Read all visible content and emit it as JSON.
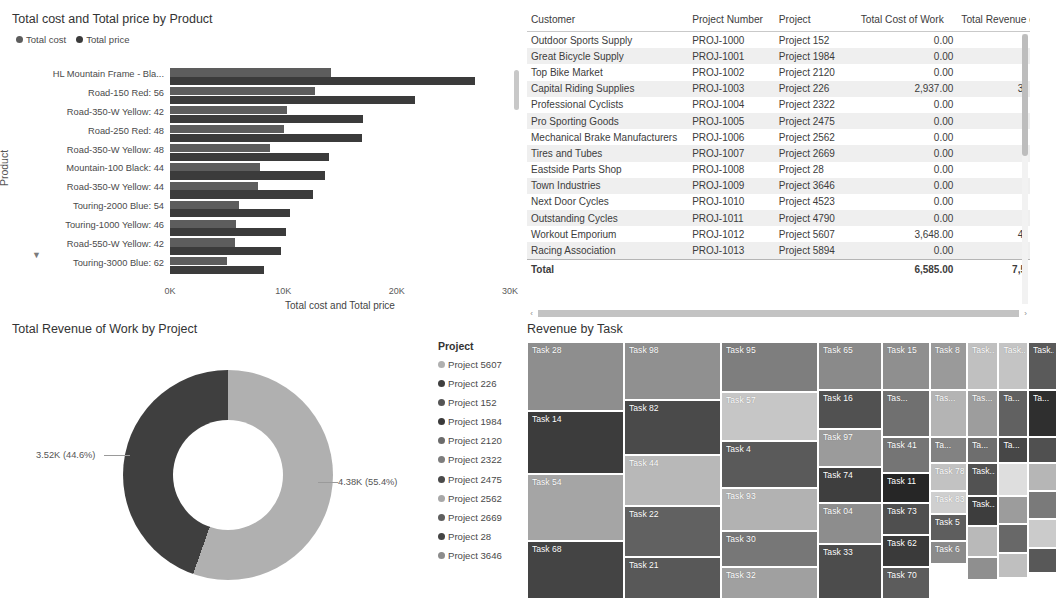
{
  "chart_data": [
    {
      "type": "bar",
      "id": "total-cost-price-by-product",
      "title": "Total cost and Total price by Product",
      "xlabel": "Total cost and Total price",
      "ylabel": "Product",
      "orientation": "horizontal",
      "grouped": true,
      "xlim": [
        0,
        30000
      ],
      "xticks": [
        "0K",
        "10K",
        "20K",
        "30K"
      ],
      "xtick_values": [
        0,
        10000,
        20000,
        30000
      ],
      "legend": [
        {
          "label": "Total cost",
          "color": "#5d5d5d"
        },
        {
          "label": "Total price",
          "color": "#3b3b3b"
        }
      ],
      "categories": [
        "HL Mountain Frame - Bla...",
        "Road-150 Red: 56",
        "Road-350-W Yellow: 42",
        "Road-250 Red: 48",
        "Road-350-W Yellow: 48",
        "Mountain-100 Black: 44",
        "Road-350-W Yellow: 44",
        "Touring-2000 Blue: 54",
        "Touring-1000 Yellow: 46",
        "Road-550-W Yellow: 42",
        "Touring-3000 Blue: 62"
      ],
      "series": [
        {
          "name": "Total cost",
          "color": "#5d5d5d",
          "values": [
            14200,
            12800,
            10300,
            10100,
            8800,
            7900,
            7800,
            6100,
            5800,
            5700,
            5000
          ]
        },
        {
          "name": "Total price",
          "color": "#3b3b3b",
          "values": [
            26900,
            21600,
            17000,
            16900,
            14000,
            13700,
            12600,
            10600,
            10200,
            9800,
            8300
          ]
        }
      ]
    },
    {
      "type": "pie",
      "id": "total-revenue-of-work-by-project",
      "title": "Total Revenue of Work by Project",
      "donut": true,
      "legend_title": "Project",
      "legend_position": "right",
      "slices": [
        {
          "label": "Project 5607",
          "value": 4380,
          "display": "4.38K (55.4%)",
          "percent": 55.4,
          "color": "#b0b0b0"
        },
        {
          "label": "Project 226",
          "value": 3520,
          "display": "3.52K (44.6%)",
          "percent": 44.6,
          "color": "#3f3f3f"
        }
      ],
      "legend_items": [
        {
          "label": "Project 5607",
          "color": "#b0b0b0"
        },
        {
          "label": "Project 226",
          "color": "#3f3f3f"
        },
        {
          "label": "Project 152",
          "color": "#555555"
        },
        {
          "label": "Project 1984",
          "color": "#3a3a3a"
        },
        {
          "label": "Project 2120",
          "color": "#6b6b6b"
        },
        {
          "label": "Project 2322",
          "color": "#7d7d7d"
        },
        {
          "label": "Project 2475",
          "color": "#4a4a4a"
        },
        {
          "label": "Project 2562",
          "color": "#a8a8a8"
        },
        {
          "label": "Project 2669",
          "color": "#5f5f5f"
        },
        {
          "label": "Project 28",
          "color": "#444444"
        },
        {
          "label": "Project 3646",
          "color": "#8c8c8c"
        }
      ],
      "more_indicator": "▼"
    },
    {
      "type": "treemap",
      "id": "revenue-by-task",
      "title": "Revenue by Task",
      "columns": [
        {
          "width_pct": 19.1,
          "cells": [
            {
              "label": "Task 28",
              "h_pct": 27.0,
              "color": "#8e8e8e"
            },
            {
              "label": "Task 14",
              "h_pct": 24.5,
              "color": "#3c3c3c"
            },
            {
              "label": "Task 54",
              "h_pct": 26.0,
              "color": "#a5a5a5"
            },
            {
              "label": "Task 68",
              "h_pct": 22.5,
              "color": "#444444"
            }
          ]
        },
        {
          "width_pct": 19.1,
          "cells": [
            {
              "label": "Task 98",
              "h_pct": 22.5,
              "color": "#909090"
            },
            {
              "label": "Task 82",
              "h_pct": 21.5,
              "color": "#4a4a4a"
            },
            {
              "label": "Task 44",
              "h_pct": 20.0,
              "color": "#b8b8b8"
            },
            {
              "label": "Task 22",
              "h_pct": 19.5,
              "color": "#616161"
            },
            {
              "label": "Task 21",
              "h_pct": 16.5,
              "color": "#585858"
            }
          ]
        },
        {
          "width_pct": 19.1,
          "cells": [
            {
              "label": "Task 95",
              "h_pct": 19.5,
              "color": "#7e7e7e"
            },
            {
              "label": "Task 57",
              "h_pct": 19.0,
              "color": "#c6c6c6"
            },
            {
              "label": "Task 4",
              "h_pct": 18.5,
              "color": "#5a5a5a"
            },
            {
              "label": "Task 93",
              "h_pct": 16.5,
              "color": "#b2b2b2"
            },
            {
              "label": "Task 30",
              "h_pct": 14.0,
              "color": "#777777"
            },
            {
              "label": "Task 32",
              "h_pct": 12.5,
              "color": "#a0a0a0"
            }
          ]
        },
        {
          "width_pct": 12.6,
          "cells": [
            {
              "label": "Task 65",
              "h_pct": 18.5,
              "color": "#8a8a8a"
            },
            {
              "label": "Task 16",
              "h_pct": 15.5,
              "color": "#515151"
            },
            {
              "label": "Task 97",
              "h_pct": 14.5,
              "color": "#9b9b9b"
            },
            {
              "label": "Task 74",
              "h_pct": 14.0,
              "color": "#3e3e3e"
            },
            {
              "label": "Task 04",
              "h_pct": 16.0,
              "color": "#8d8d8d"
            },
            {
              "label": "Task 33",
              "h_pct": 21.5,
              "color": "#4c4c4c"
            }
          ]
        },
        {
          "width_pct": 9.4,
          "cells": [
            {
              "label": "Task 15",
              "h_pct": 18.5,
              "color": "#8f8f8f"
            },
            {
              "label": "Tas...",
              "h_pct": 18.5,
              "color": "#707070"
            },
            {
              "label": "Task 41",
              "h_pct": 14.0,
              "color": "#757575"
            },
            {
              "label": "Task 11",
              "h_pct": 11.5,
              "color": "#262626"
            },
            {
              "label": "Task 73",
              "h_pct": 12.5,
              "color": "#4f4f4f"
            },
            {
              "label": "Task 62",
              "h_pct": 12.5,
              "color": "#3a3a3a"
            },
            {
              "label": "Task 70",
              "h_pct": 12.5,
              "color": "#5c5c5c"
            }
          ]
        },
        {
          "width_pct": 7.3,
          "cells": [
            {
              "label": "Task 8",
              "h_pct": 18.5,
              "color": "#9a9a9a"
            },
            {
              "label": "Tas...",
              "h_pct": 18.5,
              "color": "#b4b4b4"
            },
            {
              "label": "Ta...",
              "h_pct": 10.0,
              "color": "#828282"
            },
            {
              "label": "Task 78",
              "h_pct": 11.0,
              "color": "#c2c2c2"
            },
            {
              "label": "Task 83",
              "h_pct": 9.0,
              "color": "#cfcfcf"
            },
            {
              "label": "Task 5",
              "h_pct": 10.5,
              "color": "#5e5e5e"
            },
            {
              "label": "Task 6",
              "h_pct": 9.0,
              "color": "#8b8b8b"
            }
          ]
        },
        {
          "width_pct": 6.2,
          "cells": [
            {
              "label": "Task...",
              "h_pct": 18.5,
              "color": "#c0c0c0"
            },
            {
              "label": "Tas...",
              "h_pct": 18.5,
              "color": "#9d9d9d"
            },
            {
              "label": "Ta...",
              "h_pct": 10.0,
              "color": "#6e6e6e"
            },
            {
              "label": "Task...",
              "h_pct": 13.0,
              "color": "#525252"
            },
            {
              "label": "Task...",
              "h_pct": 11.5,
              "color": "#3d3d3d"
            },
            {
              "label": "",
              "h_pct": 12.0,
              "color": "#b9b9b9"
            },
            {
              "label": "",
              "h_pct": 9.0,
              "color": "#8f8f8f"
            }
          ]
        },
        {
          "width_pct": 5.8,
          "cells": [
            {
              "label": "Task...",
              "h_pct": 18.5,
              "color": "#c4c4c4"
            },
            {
              "label": "Ta...",
              "h_pct": 18.5,
              "color": "#616161"
            },
            {
              "label": "Ta...",
              "h_pct": 10.0,
              "color": "#474747"
            },
            {
              "label": "",
              "h_pct": 13.0,
              "color": "#dedede"
            },
            {
              "label": "",
              "h_pct": 11.0,
              "color": "#9c9c9c"
            },
            {
              "label": "",
              "h_pct": 11.0,
              "color": "#686868"
            },
            {
              "label": "",
              "h_pct": 10.0,
              "color": "#bfbfbf"
            }
          ]
        },
        {
          "width_pct": 5.8,
          "cells": [
            {
              "label": "Task...",
              "h_pct": 18.5,
              "color": "#5a5a5a"
            },
            {
              "label": "Ta...",
              "h_pct": 18.5,
              "color": "#2f2f2f"
            },
            {
              "label": "",
              "h_pct": 10.0,
              "color": "#505050"
            },
            {
              "label": "",
              "h_pct": 11.0,
              "color": "#b6b6b6"
            },
            {
              "label": "",
              "h_pct": 11.0,
              "color": "#7a7a7a"
            },
            {
              "label": "",
              "h_pct": 11.0,
              "color": "#cbcbcb"
            },
            {
              "label": "",
              "h_pct": 10.0,
              "color": "#585858"
            }
          ]
        }
      ]
    }
  ],
  "table": {
    "columns": [
      "Customer",
      "Project Number",
      "Project",
      "Total Cost of Work",
      "Total Revenue o/"
    ],
    "rows": [
      [
        "Outdoor Sports Supply",
        "PROJ-1000",
        "Project 152",
        "0.00",
        ""
      ],
      [
        "Great Bicycle Supply",
        "PROJ-1001",
        "Project 1984",
        "0.00",
        ""
      ],
      [
        "Top Bike Market",
        "PROJ-1002",
        "Project 2120",
        "0.00",
        ""
      ],
      [
        "Capital Riding Supplies",
        "PROJ-1003",
        "Project 226",
        "2,937.00",
        "3,"
      ],
      [
        "Professional Cyclists",
        "PROJ-1004",
        "Project 2322",
        "0.00",
        ""
      ],
      [
        "Pro Sporting Goods",
        "PROJ-1005",
        "Project 2475",
        "0.00",
        ""
      ],
      [
        "Mechanical Brake Manufacturers",
        "PROJ-1006",
        "Project 2562",
        "0.00",
        ""
      ],
      [
        "Tires and Tubes",
        "PROJ-1007",
        "Project 2669",
        "0.00",
        ""
      ],
      [
        "Eastside Parts Shop",
        "PROJ-1008",
        "Project 28",
        "0.00",
        ""
      ],
      [
        "Town Industries",
        "PROJ-1009",
        "Project 3646",
        "0.00",
        ""
      ],
      [
        "Next Door Cycles",
        "PROJ-1010",
        "Project 4523",
        "0.00",
        ""
      ],
      [
        "Outstanding Cycles",
        "PROJ-1011",
        "Project 4790",
        "0.00",
        ""
      ],
      [
        "Workout Emporium",
        "PROJ-1012",
        "Project 5607",
        "3,648.00",
        "4,"
      ],
      [
        "Racing Association",
        "PROJ-1013",
        "Project 5894",
        "0.00",
        ""
      ]
    ],
    "total_row": [
      "Total",
      "",
      "",
      "6,585.00",
      "7,5"
    ],
    "scroll_left_arrow": "‹",
    "scroll_right_arrow": "›"
  }
}
